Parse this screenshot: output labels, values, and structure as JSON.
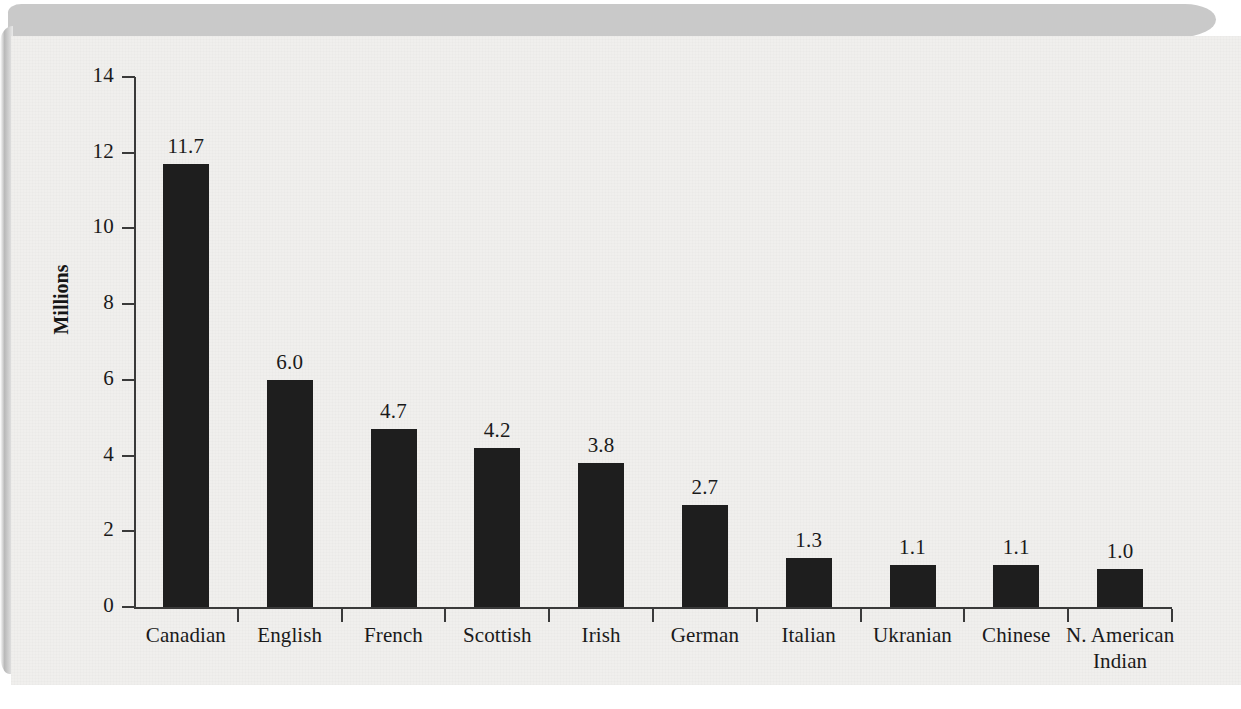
{
  "chart_data": {
    "type": "bar",
    "title": "",
    "xlabel": "",
    "ylabel": "Millions",
    "ylim": [
      0,
      14
    ],
    "ytick_step": 2,
    "grid": false,
    "legend": "none",
    "categories": [
      "Canadian",
      "English",
      "French",
      "Scottish",
      "Irish",
      "German",
      "Italian",
      "Ukranian",
      "Chinese",
      "N. American Indian"
    ],
    "category_lines": [
      [
        "Canadian"
      ],
      [
        "English"
      ],
      [
        "French"
      ],
      [
        "Scottish"
      ],
      [
        "Irish"
      ],
      [
        "German"
      ],
      [
        "Italian"
      ],
      [
        "Ukranian"
      ],
      [
        "Chinese"
      ],
      [
        "N. American",
        "Indian"
      ]
    ],
    "values": [
      11.7,
      6.0,
      4.7,
      4.2,
      3.8,
      2.7,
      1.3,
      1.1,
      1.1,
      1.0
    ],
    "value_labels": [
      "11.7",
      "6.0",
      "4.7",
      "4.2",
      "3.8",
      "2.7",
      "1.3",
      "1.1",
      "1.1",
      "1.0"
    ],
    "ytick_labels": [
      "14",
      "12",
      "10",
      "8",
      "6",
      "4",
      "2",
      "0"
    ],
    "ytick_values": [
      14,
      12,
      10,
      8,
      6,
      4,
      2,
      0
    ],
    "bar_color": "#1e1e1e",
    "axis_color": "#3a3a3a",
    "text_color": "#1a1a1a",
    "page_color": "#f0efed"
  }
}
